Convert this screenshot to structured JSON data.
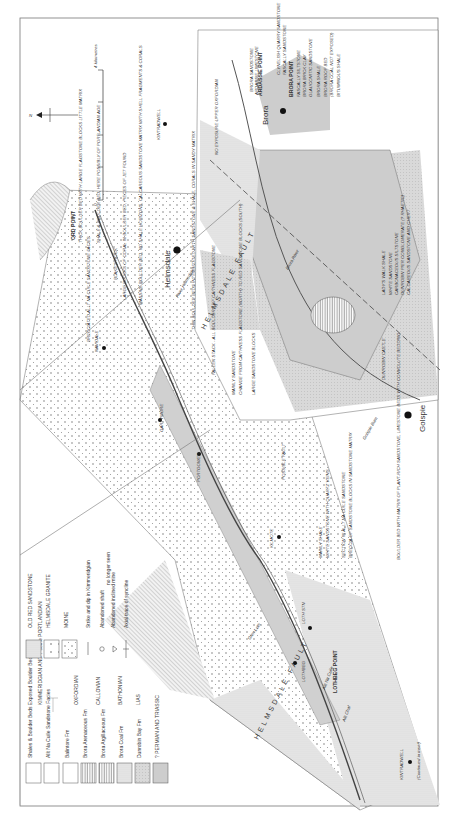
{
  "map": {
    "title": "Geological map of the Brora - Helmsdale coast",
    "orientation": "rotated 90 degrees counter-clockwise",
    "scale_bar": {
      "start": "0",
      "end": "4 kilometres"
    },
    "north_arrow": "N",
    "fault_label": "HELMSDALE FAULT",
    "continued_note": "(Continued in inset)",
    "towns": [
      {
        "name": "Brora"
      },
      {
        "name": "Helmsdale"
      },
      {
        "name": "Golspie"
      },
      {
        "name": "KINTRADWELL"
      },
      {
        "name": "KINTRADWELL"
      },
      {
        "name": "LOTHBEG"
      },
      {
        "name": "LOTH STN"
      },
      {
        "name": "KILMOTE"
      },
      {
        "name": "PORTGOWER"
      },
      {
        "name": "GARTYMORE"
      },
      {
        "name": "NAVIDALE"
      },
      {
        "name": "DUNROBIN CASTLE"
      }
    ],
    "points": [
      {
        "name": "ORD POINT"
      },
      {
        "name": "ARDASSIE POINT"
      },
      {
        "name": "BRORA POINT"
      },
      {
        "name": "LOTHBEG POINT"
      }
    ],
    "rivers": [
      {
        "name": "River Helmsdale"
      },
      {
        "name": "Glen Loth"
      },
      {
        "name": "Allt Na Cuile"
      },
      {
        "name": "Allt Chaf"
      },
      {
        "name": "Golspie Burn"
      },
      {
        "name": "Brora River"
      }
    ],
    "roads": [
      "A9",
      "A9",
      "A9"
    ],
    "annotations": [
      "THICK BOULDER BED WITH LARGE FLAGSTONE BLOCKS LITTLE MATRIX",
      "SHALE & BOULDER BED, HERE POSSIBLY OF PORTLANDIAN AGE",
      "BLAKE'S ROCK",
      "LARGE BLOCKS OF CORAL IN BOULDER BED, PIECES OF JET FOUND",
      "MASSIVE BOULDER BED, NO SHALE HORIZONS, CALCAREOUS SANDSTONE MATRIX WITH SHELL FRAGMENTS & CORALS",
      "BRECCIATED ALLT NA CUILE SANDSTONE FACIES",
      "THIN BOULDER BEDS INTERBEDDED WITH SANDSTONE & SHALE, CORALS IN SANDY MATRIX",
      "FALLEN STACK - ALL BOULDERS OF CAITHNESS FLAGSTONE",
      "MAINLY SANDSTONE",
      "CHANGE FROM CAITHNESS FLAGSTONE (NORTH) TO RED SANDSTONE BLOCKS (SOUTH)",
      "LARGE SANDSTONE BLOCKS",
      "POSSIBLE FAULT",
      "MAINLY SHALE",
      "WHITE SANDSTONE WITH QUARTZ VEINS",
      "SECTION IN ALLT NA CUILE SANDSTONE",
      "BRECCIA OF SANDSTONE BLOCKS IN SANDSTONE MATRIX",
      "BOULDER BED WITH MATRIX OF PLANT-RICH SANDSTONE, LIMESTONE BEDS WITH CONVOLUTE BEDDING",
      "NO EXPOSURE UPPER OXFORDIAN",
      "BRORA SANDSTONE",
      "ARDASSIE LIMESTONE",
      "CLYNELISH QUARRY SANDSTONE",
      "FASCALLY SANDSTONE",
      "FASCALLY SILTSTONE",
      "BRORA BRICK CLAY",
      "GLAUCONITIC SANDSTONE",
      "BRORA SHALE",
      "BRORA ROOF BED",
      "(BRORA COAL NOT EXPOSED)",
      "BITUMINOUS SHALE",
      "LADY'S WALK SHALE",
      "WHITE SANDSTONE",
      "CARBONACEOUS SILTSTONE",
      "DUNROBIN PIER CONGLOMERATE (? RHAETIC)",
      "CALCAREOUS SANDSTONE AND CHERT"
    ]
  },
  "legend": {
    "formations": [
      {
        "label": "Shales & Boulder Beds Exposed Boulder Beds",
        "pattern": "blank-box"
      },
      {
        "label": "Allt Na Cuile Sandstone Facies",
        "pattern": "blank-box"
      },
      {
        "label": "Balintore Fm",
        "pattern": "blank-box"
      },
      {
        "label": "Brora Arenaceous Fm",
        "pattern": "vertical-lines"
      },
      {
        "label": "Brora Argillaceous Fm",
        "pattern": "dense-vertical-lines"
      },
      {
        "label": "Brora Coal Fm",
        "pattern": "light-stipple"
      },
      {
        "label": "Dunrobin Bay Fm",
        "pattern": "grey-stipple"
      },
      {
        "label": "? PERMIAN AND TRIASSIC",
        "pattern": "horizontal-lines"
      }
    ],
    "ages": [
      {
        "label": "KIMMERIDGIAN AND ? some PORTLANDIAN"
      },
      {
        "label": "OXFORDIAN"
      },
      {
        "label": "CALLOVIAN"
      },
      {
        "label": "BATHONIAN"
      },
      {
        "label": "LIAS"
      }
    ],
    "basement": [
      {
        "label": "OLD RED SANDSTONE",
        "pattern": "fine-stipple"
      },
      {
        "label": "HELMSDALE GRANITE",
        "pattern": "crosses"
      },
      {
        "label": "MOINE",
        "pattern": "dots"
      }
    ],
    "symbols": [
      {
        "label": "Strike and dip in Kimmeridgian",
        "icon": "strike-dip-icon"
      },
      {
        "label": "Abandoned shaft",
        "icon": "shaft-icon"
      },
      {
        "label": "Abandoned inclined mine",
        "icon": "incline-mine-icon"
      },
      {
        "label": "no longer seen",
        "icon": ""
      },
      {
        "label": "Axial trace of syncline",
        "icon": "syncline-icon"
      }
    ]
  },
  "colors": {
    "ink": "#333333",
    "grey_fill": "#d4d4d4",
    "light_fill": "#e8e8e8",
    "frame": "#555555"
  }
}
